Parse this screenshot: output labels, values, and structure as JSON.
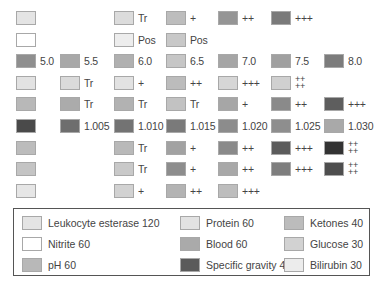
{
  "chart_data": {
    "type": "table",
    "columns_x": [
      16,
      60,
      114,
      166,
      218,
      271,
      324
    ],
    "rows": [
      {
        "name": "Leukocyte esterase",
        "cells": [
          {
            "col": 0,
            "color": "#e4e4e4",
            "label": ""
          },
          {
            "col": 2,
            "color": "#dcdcdc",
            "label": "Tr"
          },
          {
            "col": 3,
            "color": "#bdbdbd",
            "label": "+"
          },
          {
            "col": 4,
            "color": "#959595",
            "label": "++"
          },
          {
            "col": 5,
            "color": "#7a7a7a",
            "label": "+++"
          }
        ]
      },
      {
        "name": "Nitrite",
        "cells": [
          {
            "col": 0,
            "color": "#ffffff",
            "label": ""
          },
          {
            "col": 2,
            "color": "#ededed",
            "label": "Pos"
          },
          {
            "col": 3,
            "color": "#c8c8c8",
            "label": "Pos"
          }
        ]
      },
      {
        "name": "pH",
        "cells": [
          {
            "col": 0,
            "color": "#8f8f8f",
            "label": "5.0"
          },
          {
            "col": 1,
            "color": "#a8a8a8",
            "label": "5.5"
          },
          {
            "col": 2,
            "color": "#b0b0b0",
            "label": "6.0"
          },
          {
            "col": 3,
            "color": "#c6c6c6",
            "label": "6.5"
          },
          {
            "col": 4,
            "color": "#a5a5a5",
            "label": "7.0"
          },
          {
            "col": 5,
            "color": "#a0a0a0",
            "label": "7.5"
          },
          {
            "col": 6,
            "color": "#7c7c7c",
            "label": "8.0"
          }
        ]
      },
      {
        "name": "Protein",
        "cells": [
          {
            "col": 0,
            "color": "#e2e2e2",
            "label": ""
          },
          {
            "col": 1,
            "color": "#dadada",
            "label": "Tr"
          },
          {
            "col": 2,
            "color": "#e2e2e2",
            "label": "+"
          },
          {
            "col": 3,
            "color": "#bcbcbc",
            "label": "++"
          },
          {
            "col": 4,
            "color": "#d6d6d6",
            "label": "+++"
          },
          {
            "col": 5,
            "color": "#d0d0d0",
            "label": "++++"
          }
        ]
      },
      {
        "name": "Blood",
        "cells": [
          {
            "col": 0,
            "color": "#b8b8b8",
            "label": ""
          },
          {
            "col": 1,
            "color": "#ababab",
            "label": "Tr"
          },
          {
            "col": 2,
            "color": "#b2b2b2",
            "label": "Tr"
          },
          {
            "col": 3,
            "color": "#c2c2c2",
            "label": "Tr"
          },
          {
            "col": 4,
            "color": "#a6a6a6",
            "label": "+"
          },
          {
            "col": 5,
            "color": "#8a8a8a",
            "label": "++"
          },
          {
            "col": 6,
            "color": "#5e5e5e",
            "label": "+++"
          }
        ]
      },
      {
        "name": "Specific gravity",
        "cells": [
          {
            "col": 0,
            "color": "#4a4a4a",
            "label": ""
          },
          {
            "col": 1,
            "color": "#6e6e6e",
            "label": "1.005"
          },
          {
            "col": 2,
            "color": "#737373",
            "label": "1.010"
          },
          {
            "col": 3,
            "color": "#7a7a7a",
            "label": "1.015"
          },
          {
            "col": 4,
            "color": "#8c8c8c",
            "label": "1.020"
          },
          {
            "col": 5,
            "color": "#8e8e8e",
            "label": "1.025"
          },
          {
            "col": 6,
            "color": "#a9a9a9",
            "label": "1.030"
          }
        ]
      },
      {
        "name": "Ketones",
        "cells": [
          {
            "col": 0,
            "color": "#bcbcbc",
            "label": ""
          },
          {
            "col": 2,
            "color": "#b9b9b9",
            "label": "Tr"
          },
          {
            "col": 3,
            "color": "#a2a2a2",
            "label": "+"
          },
          {
            "col": 4,
            "color": "#8a8a8a",
            "label": "++"
          },
          {
            "col": 5,
            "color": "#5c5c5c",
            "label": "+++"
          },
          {
            "col": 6,
            "color": "#333333",
            "label": "++++"
          }
        ]
      },
      {
        "name": "Glucose",
        "cells": [
          {
            "col": 0,
            "color": "#c4c4c4",
            "label": ""
          },
          {
            "col": 2,
            "color": "#c9c9c9",
            "label": "Tr"
          },
          {
            "col": 3,
            "color": "#8d8d8d",
            "label": "+"
          },
          {
            "col": 4,
            "color": "#a8a8a8",
            "label": "++"
          },
          {
            "col": 5,
            "color": "#7e7e7e",
            "label": "+++"
          },
          {
            "col": 6,
            "color": "#4e4e4e",
            "label": "++++"
          }
        ]
      },
      {
        "name": "Bilirubin",
        "cells": [
          {
            "col": 0,
            "color": "#e6e6e6",
            "label": ""
          },
          {
            "col": 2,
            "color": "#d2d2d2",
            "label": "+"
          },
          {
            "col": 3,
            "color": "#b3b3b3",
            "label": "++"
          },
          {
            "col": 4,
            "color": "#bdbdbd",
            "label": "+++"
          }
        ]
      }
    ]
  },
  "legend": [
    {
      "label": "Leukocyte esterase 120",
      "color": "#e4e4e4"
    },
    {
      "label": "Protein 60",
      "color": "#e2e2e2"
    },
    {
      "label": "Ketones 40",
      "color": "#bcbcbc"
    },
    {
      "label": "Nitrite 60",
      "color": "#ffffff"
    },
    {
      "label": "Blood 60",
      "color": "#aaaaaa"
    },
    {
      "label": "Glucose 30",
      "color": "#d2d2d2"
    },
    {
      "label": "pH 60",
      "color": "#b8b8b8"
    },
    {
      "label": "Specific gravity 45",
      "color": "#5a5a5a"
    },
    {
      "label": "Bilirubin 30",
      "color": "#ececec"
    }
  ]
}
